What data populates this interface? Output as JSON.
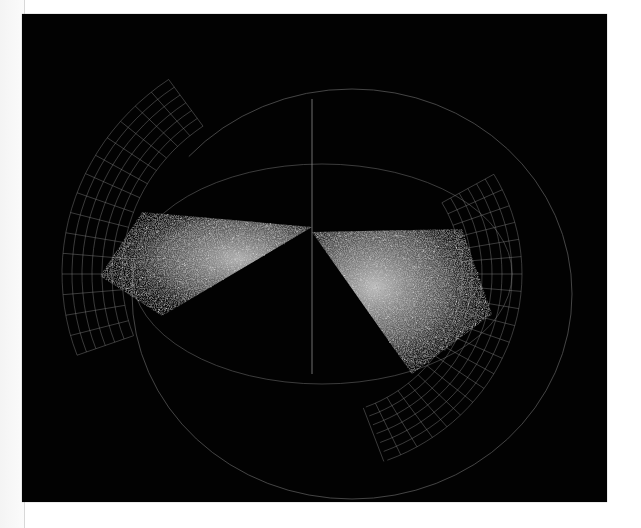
{
  "scene": {
    "description": "3D galaxy survey visualization: two dense point-cloud wedges inside a spherical wireframe on black",
    "colors": {
      "background": "#020202",
      "page": "#ffffff",
      "grid": "#8a8a8a",
      "outline": "#555555",
      "points": "#d8d8d8"
    },
    "panel": {
      "x": 22,
      "y": 14,
      "width": 585,
      "height": 488
    },
    "axis_line": {
      "x1": 290,
      "y1": 85,
      "x2": 290,
      "y2": 360
    },
    "outer_ring": {
      "cx": 330,
      "cy": 280,
      "rx": 220,
      "ry": 205
    },
    "inner_ring": {
      "cx": 300,
      "cy": 260,
      "rx": 190,
      "ry": 110
    },
    "wedges": [
      {
        "name": "left-wedge",
        "apex": [
          290,
          213
        ],
        "polygon": "290,213 120,198 78,262 140,302"
      },
      {
        "name": "right-wedge",
        "apex": [
          290,
          218
        ],
        "polygon": "290,218 440,215 470,300 390,360"
      }
    ],
    "grid_shells": [
      {
        "name": "left-shell",
        "cx": 290,
        "cy": 260,
        "radii": [
          190,
          200,
          210,
          220,
          230,
          240,
          250
        ],
        "start_deg": 160,
        "end_deg": 235
      },
      {
        "name": "right-shell",
        "cx": 290,
        "cy": 260,
        "radii": [
          150,
          160,
          170,
          180,
          190,
          200,
          210
        ],
        "start_deg": -30,
        "end_deg": 70
      }
    ]
  }
}
